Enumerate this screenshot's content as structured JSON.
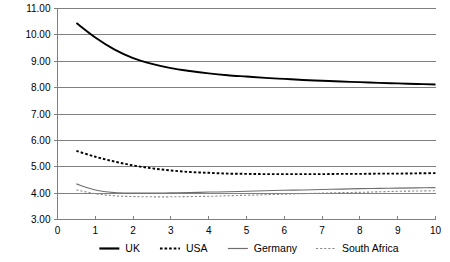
{
  "chart_data": {
    "type": "line",
    "title": "",
    "subtitle": "",
    "xlabel": "",
    "ylabel": "",
    "xlim": [
      0,
      10
    ],
    "ylim": [
      3.0,
      11.0
    ],
    "grid": true,
    "legend_position": "bottom",
    "xticks": [
      "0",
      "1",
      "2",
      "3",
      "4",
      "5",
      "6",
      "7",
      "8",
      "9",
      "10"
    ],
    "xtick_values": [
      0,
      1,
      2,
      3,
      4,
      5,
      6,
      7,
      8,
      9,
      10
    ],
    "yticks": [
      "3.00",
      "4.00",
      "5.00",
      "6.00",
      "7.00",
      "8.00",
      "9.00",
      "10.00",
      "11.00"
    ],
    "ytick_values": [
      3,
      4,
      5,
      6,
      7,
      8,
      9,
      10,
      11
    ],
    "x": [
      0.5,
      1.0,
      1.5,
      2.0,
      2.5,
      3.0,
      3.5,
      4.0,
      4.5,
      5.0,
      5.5,
      6.0,
      6.5,
      7.0,
      7.5,
      8.0,
      8.5,
      9.0,
      9.5,
      10.0
    ],
    "series": [
      {
        "name": "UK",
        "color": "#000000",
        "style": "solid",
        "width": 1.9,
        "values": [
          10.45,
          9.9,
          9.45,
          9.12,
          8.9,
          8.74,
          8.63,
          8.54,
          8.47,
          8.42,
          8.37,
          8.33,
          8.29,
          8.26,
          8.23,
          8.21,
          8.18,
          8.16,
          8.14,
          8.12
        ]
      },
      {
        "name": "USA",
        "color": "#000000",
        "style": "dashed",
        "width": 1.9,
        "values": [
          5.6,
          5.38,
          5.2,
          5.05,
          4.94,
          4.86,
          4.8,
          4.77,
          4.74,
          4.73,
          4.72,
          4.72,
          4.72,
          4.72,
          4.73,
          4.73,
          4.74,
          4.74,
          4.75,
          4.76
        ]
      },
      {
        "name": "Germany",
        "color": "#6e6e6e",
        "style": "solid",
        "width": 1.1,
        "values": [
          4.35,
          4.12,
          4.02,
          4.0,
          4.0,
          4.01,
          4.02,
          4.04,
          4.05,
          4.07,
          4.09,
          4.11,
          4.12,
          4.14,
          4.15,
          4.17,
          4.18,
          4.19,
          4.2,
          4.21
        ]
      },
      {
        "name": "South Africa",
        "color": "#8a8a8a",
        "style": "dashed",
        "width": 1.1,
        "values": [
          4.12,
          3.98,
          3.9,
          3.87,
          3.86,
          3.86,
          3.87,
          3.88,
          3.9,
          3.92,
          3.94,
          3.96,
          3.98,
          4.0,
          4.02,
          4.03,
          4.05,
          4.07,
          4.08,
          4.09
        ]
      }
    ],
    "legend": [
      {
        "label": "UK",
        "color": "#000000",
        "style": "solid",
        "width": 2.2
      },
      {
        "label": "USA",
        "color": "#000000",
        "style": "dashed",
        "width": 2.2
      },
      {
        "label": "Germany",
        "color": "#6e6e6e",
        "style": "solid",
        "width": 1.2
      },
      {
        "label": "South Africa",
        "color": "#8a8a8a",
        "style": "dashed",
        "width": 1.2
      }
    ]
  }
}
